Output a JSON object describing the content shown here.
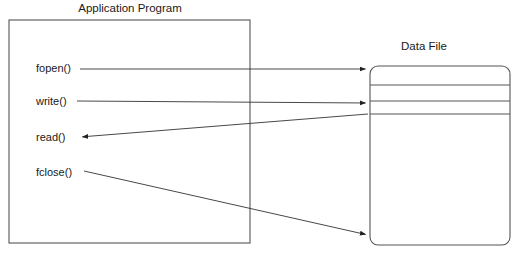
{
  "diagram": {
    "type": "file-io-flow",
    "background_color": "#ffffff",
    "line_color": "#333333",
    "box_stroke_color": "#555555",
    "text_color": "#1a1a1a",
    "left_box": {
      "title": "Application Program",
      "title_x": 130,
      "title_y": 12,
      "x": 9,
      "y": 20,
      "width": 241,
      "height": 223,
      "calls": [
        {
          "label": "fopen()",
          "label_x": 36,
          "label_y": 72,
          "direction": "to-file",
          "line": {
            "x1": 80,
            "y1": 69,
            "x2": 368,
            "y2": 69
          },
          "arrow_at": {
            "x": 368,
            "y": 69
          }
        },
        {
          "label": "write()",
          "label_x": 36,
          "label_y": 105,
          "direction": "to-file",
          "line": {
            "x1": 77,
            "y1": 101,
            "x2": 368,
            "y2": 103
          },
          "arrow_at": {
            "x": 368,
            "y": 103
          }
        },
        {
          "label": "read()",
          "label_x": 36,
          "label_y": 141,
          "direction": "from-file",
          "line": {
            "x1": 368,
            "y1": 114,
            "x2": 80,
            "y2": 137
          },
          "arrow_at": {
            "x": 80,
            "y": 137
          }
        },
        {
          "label": "fclose()",
          "label_x": 36,
          "label_y": 176,
          "direction": "to-file",
          "line": {
            "x1": 84,
            "y1": 171,
            "x2": 368,
            "y2": 235
          },
          "arrow_at": {
            "x": 368,
            "y": 235
          }
        }
      ]
    },
    "right_box": {
      "title": "Data File",
      "title_x": 424,
      "title_y": 50,
      "x": 370,
      "y": 66,
      "width": 140,
      "height": 179,
      "corner_radius": 8,
      "divider_y": [
        85,
        101,
        114
      ]
    }
  }
}
